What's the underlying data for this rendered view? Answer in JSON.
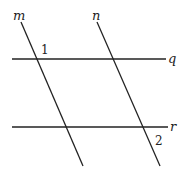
{
  "diagram": {
    "lines": [
      {
        "id": "m",
        "label": "m",
        "x1": 21,
        "y1": 22,
        "x2": 83,
        "y2": 166
      },
      {
        "id": "n",
        "label": "n",
        "x1": 97,
        "y1": 22,
        "x2": 160,
        "y2": 166
      },
      {
        "id": "q",
        "label": "q",
        "x1": 12,
        "y1": 59,
        "x2": 166,
        "y2": 59
      },
      {
        "id": "r",
        "label": "r",
        "x1": 12,
        "y1": 127,
        "x2": 168,
        "y2": 127
      }
    ],
    "line_labels": {
      "m": "m",
      "n": "n",
      "q": "q",
      "r": "r"
    },
    "angle_labels": {
      "angle1": "1",
      "angle2": "2"
    },
    "colors": {
      "stroke": "#222222",
      "background": "#ffffff"
    }
  }
}
